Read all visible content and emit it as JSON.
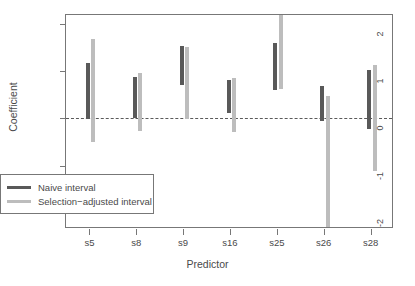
{
  "chart_data": {
    "type": "bar",
    "title": "",
    "xlabel": "Predictor",
    "ylabel": "Coefficient",
    "categories": [
      "s5",
      "s8",
      "s9",
      "s16",
      "s25",
      "s26",
      "s28"
    ],
    "ylim": [
      -2.35,
      2.2
    ],
    "yticks": [
      2,
      1,
      0,
      -1,
      -2
    ],
    "ytick_labels": [
      "2",
      "1",
      "0",
      "-1",
      "-2"
    ],
    "grid": false,
    "zero_reference_line": 0,
    "legend_position": "bottom-left",
    "series": [
      {
        "name": "Naive interval",
        "color": "#595959",
        "type": "interval",
        "lower": [
          -0.02,
          0.0,
          0.72,
          0.12,
          0.6,
          -0.05,
          -0.23
        ],
        "upper": [
          1.17,
          0.88,
          1.54,
          0.81,
          1.6,
          0.68,
          1.03
        ]
      },
      {
        "name": "Selection-adjusted interval",
        "color": "#bdbdbd",
        "type": "interval",
        "lower": [
          -0.5,
          -0.26,
          -0.02,
          -0.28,
          0.62,
          -2.35,
          -1.12
        ],
        "upper": [
          1.68,
          0.97,
          1.51,
          0.85,
          2.2,
          0.47,
          1.13
        ]
      }
    ]
  },
  "legend": {
    "items": [
      {
        "label": "Naive interval",
        "color": "#595959"
      },
      {
        "label": "Selection−adjusted interval",
        "color": "#bdbdbd"
      }
    ]
  }
}
